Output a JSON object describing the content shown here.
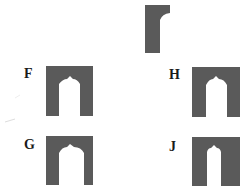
{
  "question": {
    "given_piece": {
      "name": "target-shape",
      "color": "#5a5a5a"
    }
  },
  "options": [
    {
      "label": "F",
      "color": "#5a5a5a"
    },
    {
      "label": "H",
      "color": "#5a5a5a"
    },
    {
      "label": "G",
      "color": "#5a5a5a"
    },
    {
      "label": "J",
      "color": "#5a5a5a"
    }
  ]
}
